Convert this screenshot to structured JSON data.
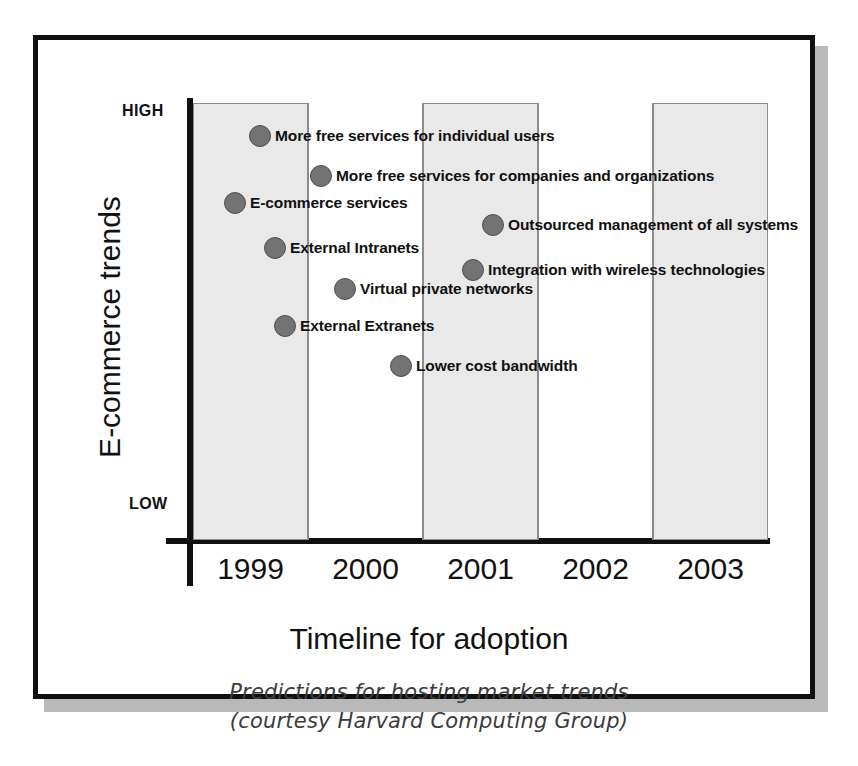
{
  "figure": {
    "caption_line1": "Predictions for hosting market trends",
    "caption_line2": "(courtesy Harvard Computing Group)"
  },
  "chart_data": {
    "type": "scatter",
    "title": "",
    "xlabel": "Timeline for adoption",
    "ylabel": "E-commerce trends",
    "x_ticks": [
      "1999",
      "2000",
      "2001",
      "2002",
      "2003"
    ],
    "y_ticks": [
      "HIGH",
      "LOW"
    ],
    "y_axis_high_label": "HIGH",
    "y_axis_low_label": "LOW",
    "xlim": [
      "1999",
      "2003"
    ],
    "ylim": [
      "LOW",
      "HIGH"
    ],
    "grid": false,
    "legend": "none",
    "bands": [
      {
        "year": "1999",
        "shaded": true
      },
      {
        "year": "2000",
        "shaded": false
      },
      {
        "year": "2001",
        "shaded": true
      },
      {
        "year": "2002",
        "shaded": false
      },
      {
        "year": "2003",
        "shaded": true
      }
    ],
    "points": [
      {
        "label": "More free services for individual users",
        "x_year": 1999.5,
        "y_rank": 1,
        "px": 67,
        "py": 33
      },
      {
        "label": "More free services for companies and organizations",
        "x_year": 2000.0,
        "y_rank": 2,
        "px": 128,
        "py": 73
      },
      {
        "label": "E-commerce services",
        "x_year": 1999.3,
        "y_rank": 3,
        "px": 42,
        "py": 100
      },
      {
        "label": "Outsourced management of all systems",
        "x_year": 2001.2,
        "y_rank": 4,
        "px": 300,
        "py": 122
      },
      {
        "label": "External Intranets",
        "x_year": 1999.5,
        "y_rank": 5,
        "px": 82,
        "py": 145
      },
      {
        "label": "Integration with wireless technologies",
        "x_year": 2001.1,
        "y_rank": 6,
        "px": 280,
        "py": 167
      },
      {
        "label": "Virtual private networks",
        "x_year": 2000.2,
        "y_rank": 7,
        "px": 152,
        "py": 186
      },
      {
        "label": "External Extranets",
        "x_year": 1999.4,
        "y_rank": 8,
        "px": 92,
        "py": 223
      },
      {
        "label": "Lower cost bandwidth",
        "x_year": 2000.6,
        "y_rank": 9,
        "px": 208,
        "py": 263
      }
    ]
  }
}
